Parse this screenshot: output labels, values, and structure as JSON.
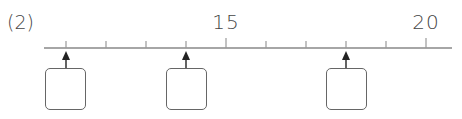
{
  "problem_label": "(2)",
  "number_line": {
    "start_value": 10,
    "end_value": 20,
    "tick_step": 1,
    "labeled_ticks": [
      {
        "value": 15,
        "label": "15"
      },
      {
        "value": 20,
        "label": "20"
      }
    ],
    "arrow_values": [
      11,
      14,
      18
    ],
    "line_color": "#888888",
    "tick_color": "#888888"
  },
  "answer_boxes": [
    {
      "points_to": 11,
      "value": ""
    },
    {
      "points_to": 14,
      "value": ""
    },
    {
      "points_to": 18,
      "value": ""
    }
  ]
}
